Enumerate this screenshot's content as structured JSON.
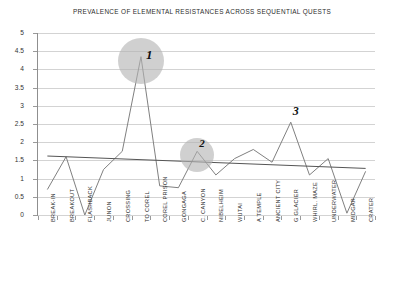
{
  "chart_data": {
    "type": "line",
    "title": "PREVALENCE OF ELEMENTAL RESISTANCES ACROSS SEQUENTIAL QUESTS",
    "xlabel": "",
    "ylabel": "",
    "ylim": [
      0,
      5
    ],
    "ytick_step": 0.5,
    "grid": true,
    "legend": "none",
    "categories": [
      "BREAK-IN",
      "BREAKOUT",
      "FLASHBACK",
      "JUNON",
      "CROSSING",
      "TO COREL",
      "COREL PRISON",
      "GONGAGA",
      "C. CANYON",
      "NIBELHEIM",
      "WUTAI",
      "A TEMPLE",
      "ANCIENT CITY",
      "G GLACIER",
      "WHIRL. MAZE",
      "UNDERWATER",
      "MIDGAR",
      "CRATER"
    ],
    "ytick_labels": [
      "0",
      "0.5",
      "1",
      "1.5",
      "2",
      "2.5",
      "3",
      "3.5",
      "4",
      "4.5",
      "5"
    ],
    "series": [
      {
        "name": "resistances",
        "color": "#808080",
        "values": [
          0.7,
          1.6,
          0.0,
          1.25,
          1.75,
          4.35,
          0.8,
          0.75,
          1.75,
          1.1,
          1.55,
          1.8,
          1.45,
          2.55,
          1.1,
          1.55,
          0.05,
          1.2
        ]
      }
    ],
    "trendline": {
      "name": "linear-trend",
      "color": "#555555",
      "start_value": 1.62,
      "end_value": 1.28
    },
    "annotations": [
      {
        "label": "1",
        "category": "TO COREL",
        "value": 4.35,
        "marker": "circle"
      },
      {
        "label": "2",
        "category": "C. CANYON",
        "value": 1.75,
        "marker": "circle"
      },
      {
        "label": "3",
        "category": "G GLACIER",
        "value": 2.55,
        "marker": "none"
      }
    ]
  }
}
